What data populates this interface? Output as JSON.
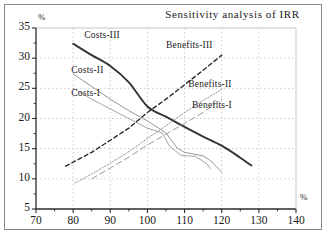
{
  "figure": {
    "title": "Sensitivity analysis of IRR",
    "y_axis_unit": "%",
    "x_axis_unit": "%"
  },
  "chart_data": {
    "type": "line",
    "title": "Sensitivity analysis of IRR",
    "xlabel": "%",
    "ylabel": "%",
    "xlim": [
      70,
      140
    ],
    "ylim": [
      5,
      35
    ],
    "xticks": [
      70,
      80,
      90,
      100,
      110,
      120,
      130,
      140
    ],
    "yticks": [
      5,
      10,
      15,
      20,
      25,
      30,
      35
    ],
    "grid": true,
    "legend": "inline-labels",
    "series": [
      {
        "name": "Costs-III",
        "style": "solid-thick",
        "color": "#333333",
        "label_x": 83,
        "label_y": 33.6,
        "points": [
          {
            "x": 80,
            "y": 32.4
          },
          {
            "x": 85,
            "y": 30.5
          },
          {
            "x": 90,
            "y": 28.7
          },
          {
            "x": 95,
            "y": 26.0
          },
          {
            "x": 100,
            "y": 22.0
          },
          {
            "x": 105,
            "y": 20.3
          },
          {
            "x": 110,
            "y": 18.6
          },
          {
            "x": 115,
            "y": 17.0
          },
          {
            "x": 120,
            "y": 15.5
          },
          {
            "x": 125,
            "y": 13.5
          },
          {
            "x": 128,
            "y": 12.2
          }
        ]
      },
      {
        "name": "Costs-II",
        "style": "solid-thin",
        "color": "#8a8a8a",
        "label_x": 79.5,
        "label_y": 27.8,
        "points": [
          {
            "x": 80,
            "y": 27.4
          },
          {
            "x": 85,
            "y": 25.3
          },
          {
            "x": 90,
            "y": 23.2
          },
          {
            "x": 95,
            "y": 21.3
          },
          {
            "x": 100,
            "y": 19.6
          },
          {
            "x": 105,
            "y": 17.6
          },
          {
            "x": 108,
            "y": 15.1
          },
          {
            "x": 110,
            "y": 14.4
          },
          {
            "x": 115,
            "y": 13.8
          },
          {
            "x": 117,
            "y": 13.0
          },
          {
            "x": 120,
            "y": 11.1
          }
        ]
      },
      {
        "name": "Costs-I",
        "style": "solid-thin",
        "color": "#9a9a9a",
        "label_x": 79.5,
        "label_y": 24.0,
        "points": [
          {
            "x": 80,
            "y": 25.0
          },
          {
            "x": 85,
            "y": 23.2
          },
          {
            "x": 90,
            "y": 21.6
          },
          {
            "x": 95,
            "y": 20.0
          },
          {
            "x": 100,
            "y": 18.4
          },
          {
            "x": 104,
            "y": 17.6
          },
          {
            "x": 106,
            "y": 15.4
          },
          {
            "x": 109,
            "y": 13.9
          },
          {
            "x": 113,
            "y": 13.7
          },
          {
            "x": 116,
            "y": 12.5
          },
          {
            "x": 117,
            "y": 11.7
          }
        ]
      },
      {
        "name": "Benefits-III",
        "style": "dashed",
        "color": "#2a2a2a",
        "label_x": 105,
        "label_y": 32.0,
        "points": [
          {
            "x": 78,
            "y": 12.1
          },
          {
            "x": 85,
            "y": 14.4
          },
          {
            "x": 90,
            "y": 16.4
          },
          {
            "x": 95,
            "y": 18.4
          },
          {
            "x": 100,
            "y": 21.0
          },
          {
            "x": 105,
            "y": 23.2
          },
          {
            "x": 110,
            "y": 25.6
          },
          {
            "x": 115,
            "y": 28.0
          },
          {
            "x": 120,
            "y": 30.5
          }
        ]
      },
      {
        "name": "Benefits-II",
        "style": "dotted",
        "color": "#909090",
        "label_x": 111,
        "label_y": 25.6,
        "points": [
          {
            "x": 80.5,
            "y": 9.3
          },
          {
            "x": 85,
            "y": 10.8
          },
          {
            "x": 90,
            "y": 12.6
          },
          {
            "x": 95,
            "y": 14.5
          },
          {
            "x": 100,
            "y": 16.7
          },
          {
            "x": 105,
            "y": 18.8
          },
          {
            "x": 110,
            "y": 21.0
          },
          {
            "x": 115,
            "y": 23.0
          },
          {
            "x": 120,
            "y": 24.8
          }
        ]
      },
      {
        "name": "Benefits-I",
        "style": "dash-long",
        "color": "#9a9a9a",
        "label_x": 112,
        "label_y": 22.0,
        "points": [
          {
            "x": 85,
            "y": 10.0
          },
          {
            "x": 90,
            "y": 11.8
          },
          {
            "x": 95,
            "y": 13.6
          },
          {
            "x": 100,
            "y": 15.6
          },
          {
            "x": 105,
            "y": 17.4
          },
          {
            "x": 110,
            "y": 19.2
          },
          {
            "x": 115,
            "y": 21.0
          },
          {
            "x": 120,
            "y": 23.2
          }
        ]
      }
    ]
  },
  "axes": {
    "y_labels": [
      "35",
      "30",
      "25",
      "20",
      "15",
      "10",
      "5"
    ],
    "x_labels": [
      "70",
      "80",
      "90",
      "100",
      "110",
      "120",
      "130",
      "140"
    ]
  },
  "series_labels": {
    "costs_iii": "Costs-III",
    "costs_ii": "Costs-II",
    "costs_i": "Costs-I",
    "benefits_iii": "Benefits-III",
    "benefits_ii": "Benefits-II",
    "benefits_i": "Benefits-I"
  },
  "colors": {
    "axis": "#2a2a2a",
    "grid": "#b9b9b9",
    "frame": "#8a8a8a",
    "costs_iii": "#333333",
    "costs_ii": "#8a8a8a",
    "costs_i": "#9a9a9a",
    "benefits_iii": "#2a2a2a",
    "benefits_ii": "#909090",
    "benefits_i": "#9a9a9a"
  }
}
